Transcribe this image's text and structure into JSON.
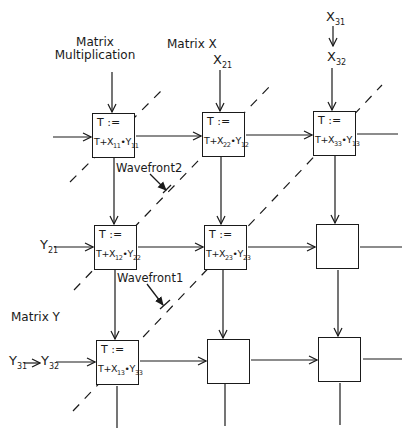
{
  "title": "Matrix Multiplication",
  "labels": {
    "matrix_mult_line1": "Matrix",
    "matrix_mult_line2": "Multiplication",
    "matrix_x": "Matrix X",
    "matrix_y": "Matrix Y",
    "wavefront1": "Wavefront1",
    "wavefront2": "Wavefront2"
  },
  "inputs": {
    "x_col2": {
      "base": "X",
      "sub": "21"
    },
    "x_col3_top": {
      "base": "X",
      "sub": "31"
    },
    "x_col3": {
      "base": "X",
      "sub": "32"
    },
    "y_row2": {
      "base": "Y",
      "sub": "21"
    },
    "y_row3_left": {
      "base": "Y",
      "sub": "31"
    },
    "y_row3": {
      "base": "Y",
      "sub": "32"
    }
  },
  "cells": [
    {
      "row": 1,
      "col": 1,
      "assign": "T :=",
      "expr": {
        "t": "T+X",
        "xsub": "11",
        "dot": "•",
        "y": "Y",
        "ysub": "11"
      }
    },
    {
      "row": 1,
      "col": 2,
      "assign": "T :=",
      "expr": {
        "t": "T+X",
        "xsub": "22",
        "dot": "•",
        "y": "Y",
        "ysub": "12"
      }
    },
    {
      "row": 1,
      "col": 3,
      "assign": "T :=",
      "expr": {
        "t": "T+X",
        "xsub": "33",
        "dot": "•",
        "y": "Y",
        "ysub": "13"
      }
    },
    {
      "row": 2,
      "col": 1,
      "assign": "T :=",
      "expr": {
        "t": "T+X",
        "xsub": "12",
        "dot": "•",
        "y": "Y",
        "ysub": "22"
      }
    },
    {
      "row": 2,
      "col": 2,
      "assign": "T :=",
      "expr": {
        "t": "T+X",
        "xsub": "23",
        "dot": "•",
        "y": "Y",
        "ysub": "23"
      }
    },
    {
      "row": 2,
      "col": 3,
      "assign": "",
      "expr": null
    },
    {
      "row": 3,
      "col": 1,
      "assign": "T :=",
      "expr": {
        "t": "T+X",
        "xsub": "13",
        "dot": "•",
        "y": "Y",
        "ysub": "33"
      }
    },
    {
      "row": 3,
      "col": 2,
      "assign": "",
      "expr": null
    },
    {
      "row": 3,
      "col": 3,
      "assign": "",
      "expr": null
    }
  ],
  "colors": {
    "ink": "#1a1a1a",
    "background": "#ffffff"
  }
}
